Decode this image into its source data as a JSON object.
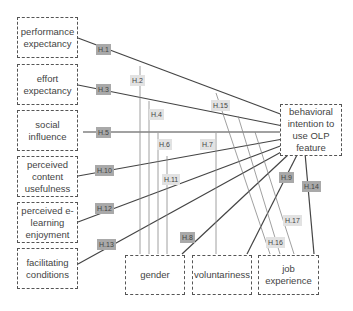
{
  "constructs": {
    "performance_expectancy": "performance expectancy",
    "effort_expectancy": "effort expectancy",
    "social_influence": "social influence",
    "perceived_content_usefulness": "perceived content usefulness",
    "perceived_elearning_enjoyment": "perceived e-learning enjoyment",
    "facilitating_conditions": "facilitating conditions",
    "behavioral_intention": "behavioral intention to use OLP feature",
    "gender": "gender",
    "voluntariness": "voluntariness",
    "job_experience": "job experience"
  },
  "hypotheses": {
    "h1": "H.1",
    "h2": "H.2",
    "h3": "H.3",
    "h4": "H.4",
    "h5": "H.5",
    "h6": "H.6",
    "h7": "H.7",
    "h8": "H.8",
    "h9": "H.9",
    "h10": "H.10",
    "h11": "H.11",
    "h12": "H.12",
    "h13": "H.13",
    "h14": "H.14",
    "h15": "H.15",
    "h16": "H.16",
    "h17": "H.17"
  },
  "colors": {
    "direct_label": "#a9a9a9",
    "moderation_label": "#e2e2e2",
    "line": "#444444"
  }
}
